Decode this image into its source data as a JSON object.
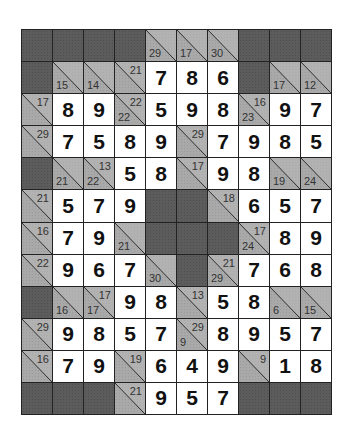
{
  "puzzle": {
    "type": "kakuro",
    "cols": 10,
    "rows": 12,
    "colors": {
      "blank": "#5c5c5c",
      "clue": "#a9a9a9",
      "entry": "#ffffff",
      "line": "#222222"
    },
    "grid": [
      [
        {
          "t": "b"
        },
        {
          "t": "b"
        },
        {
          "t": "b"
        },
        {
          "t": "b"
        },
        {
          "t": "c",
          "d": "29"
        },
        {
          "t": "c",
          "d": "17"
        },
        {
          "t": "c",
          "d": "30"
        },
        {
          "t": "b"
        },
        {
          "t": "b"
        },
        {
          "t": "b"
        }
      ],
      [
        {
          "t": "b"
        },
        {
          "t": "c",
          "d": "15"
        },
        {
          "t": "c",
          "d": "14"
        },
        {
          "t": "c",
          "a": "21"
        },
        {
          "t": "e",
          "v": "7"
        },
        {
          "t": "e",
          "v": "8"
        },
        {
          "t": "e",
          "v": "6"
        },
        {
          "t": "b"
        },
        {
          "t": "c",
          "d": "17"
        },
        {
          "t": "c",
          "d": "12"
        }
      ],
      [
        {
          "t": "c",
          "a": "17"
        },
        {
          "t": "e",
          "v": "8"
        },
        {
          "t": "e",
          "v": "9"
        },
        {
          "t": "c",
          "d": "22",
          "a": "22"
        },
        {
          "t": "e",
          "v": "5"
        },
        {
          "t": "e",
          "v": "9"
        },
        {
          "t": "e",
          "v": "8"
        },
        {
          "t": "c",
          "d": "23",
          "a": "16"
        },
        {
          "t": "e",
          "v": "9"
        },
        {
          "t": "e",
          "v": "7"
        }
      ],
      [
        {
          "t": "c",
          "a": "29"
        },
        {
          "t": "e",
          "v": "7"
        },
        {
          "t": "e",
          "v": "5"
        },
        {
          "t": "e",
          "v": "8"
        },
        {
          "t": "e",
          "v": "9"
        },
        {
          "t": "c",
          "a": "29"
        },
        {
          "t": "e",
          "v": "7"
        },
        {
          "t": "e",
          "v": "9"
        },
        {
          "t": "e",
          "v": "8"
        },
        {
          "t": "e",
          "v": "5"
        }
      ],
      [
        {
          "t": "b"
        },
        {
          "t": "c",
          "d": "21"
        },
        {
          "t": "c",
          "d": "22",
          "a": "13"
        },
        {
          "t": "e",
          "v": "5"
        },
        {
          "t": "e",
          "v": "8"
        },
        {
          "t": "c",
          "a": "17"
        },
        {
          "t": "e",
          "v": "9"
        },
        {
          "t": "e",
          "v": "8"
        },
        {
          "t": "c",
          "d": "19"
        },
        {
          "t": "c",
          "d": "24"
        }
      ],
      [
        {
          "t": "c",
          "a": "21"
        },
        {
          "t": "e",
          "v": "5"
        },
        {
          "t": "e",
          "v": "7"
        },
        {
          "t": "e",
          "v": "9"
        },
        {
          "t": "b"
        },
        {
          "t": "b"
        },
        {
          "t": "c",
          "a": "18"
        },
        {
          "t": "e",
          "v": "6"
        },
        {
          "t": "e",
          "v": "5"
        },
        {
          "t": "e",
          "v": "7"
        }
      ],
      [
        {
          "t": "c",
          "a": "16"
        },
        {
          "t": "e",
          "v": "7"
        },
        {
          "t": "e",
          "v": "9"
        },
        {
          "t": "c",
          "d": "21"
        },
        {
          "t": "b"
        },
        {
          "t": "b"
        },
        {
          "t": "b"
        },
        {
          "t": "c",
          "d": "24",
          "a": "17"
        },
        {
          "t": "e",
          "v": "8"
        },
        {
          "t": "e",
          "v": "9"
        }
      ],
      [
        {
          "t": "c",
          "a": "22"
        },
        {
          "t": "e",
          "v": "9"
        },
        {
          "t": "e",
          "v": "6"
        },
        {
          "t": "e",
          "v": "7"
        },
        {
          "t": "c",
          "d": "30"
        },
        {
          "t": "b"
        },
        {
          "t": "c",
          "d": "29",
          "a": "21"
        },
        {
          "t": "e",
          "v": "7"
        },
        {
          "t": "e",
          "v": "6"
        },
        {
          "t": "e",
          "v": "8"
        }
      ],
      [
        {
          "t": "b"
        },
        {
          "t": "c",
          "d": "16"
        },
        {
          "t": "c",
          "d": "17",
          "a": "17"
        },
        {
          "t": "e",
          "v": "9"
        },
        {
          "t": "e",
          "v": "8"
        },
        {
          "t": "c",
          "a": "13"
        },
        {
          "t": "e",
          "v": "5"
        },
        {
          "t": "e",
          "v": "8"
        },
        {
          "t": "c",
          "d": "6"
        },
        {
          "t": "c",
          "d": "15"
        }
      ],
      [
        {
          "t": "c",
          "a": "29"
        },
        {
          "t": "e",
          "v": "9"
        },
        {
          "t": "e",
          "v": "8"
        },
        {
          "t": "e",
          "v": "5"
        },
        {
          "t": "e",
          "v": "7"
        },
        {
          "t": "c",
          "d": "9",
          "a": "29"
        },
        {
          "t": "e",
          "v": "8"
        },
        {
          "t": "e",
          "v": "9"
        },
        {
          "t": "e",
          "v": "5"
        },
        {
          "t": "e",
          "v": "7"
        }
      ],
      [
        {
          "t": "c",
          "a": "16"
        },
        {
          "t": "e",
          "v": "7"
        },
        {
          "t": "e",
          "v": "9"
        },
        {
          "t": "c",
          "a": "19"
        },
        {
          "t": "e",
          "v": "6"
        },
        {
          "t": "e",
          "v": "4"
        },
        {
          "t": "e",
          "v": "9"
        },
        {
          "t": "c",
          "a": "9"
        },
        {
          "t": "e",
          "v": "1"
        },
        {
          "t": "e",
          "v": "8"
        }
      ],
      [
        {
          "t": "b"
        },
        {
          "t": "b"
        },
        {
          "t": "b"
        },
        {
          "t": "c",
          "a": "21"
        },
        {
          "t": "e",
          "v": "9"
        },
        {
          "t": "e",
          "v": "5"
        },
        {
          "t": "e",
          "v": "7"
        },
        {
          "t": "b"
        },
        {
          "t": "b"
        },
        {
          "t": "b"
        }
      ]
    ]
  }
}
